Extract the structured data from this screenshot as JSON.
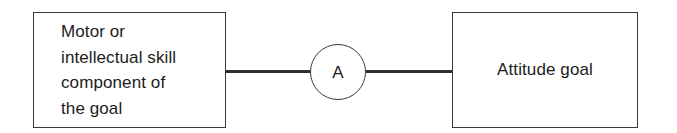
{
  "diagram": {
    "type": "flow-relationship-diagram",
    "background_color": "#ffffff",
    "stroke_color": "#3a3a3a",
    "connector_color": "#303030",
    "text_color": "#1c1c1c",
    "nodes": [
      {
        "id": "skill-component",
        "shape": "rectangle",
        "label": "Motor or\nintellectual skill\ncomponent of\nthe goal",
        "align": "left"
      },
      {
        "id": "relation",
        "shape": "circle",
        "label": "A",
        "align": "center"
      },
      {
        "id": "attitude-goal",
        "shape": "rectangle",
        "label": "Attitude goal",
        "align": "center"
      }
    ],
    "edges": [
      {
        "id": "edge-skill-to-relation",
        "from": "skill-component",
        "to": "relation",
        "style": "solid"
      },
      {
        "id": "edge-relation-to-goal",
        "from": "relation",
        "to": "attitude-goal",
        "style": "solid"
      }
    ]
  }
}
